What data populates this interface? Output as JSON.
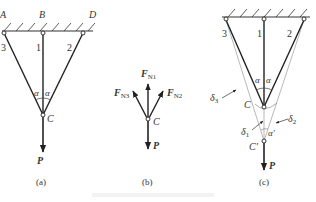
{
  "figure": {
    "panels": [
      {
        "id": "a",
        "caption": "(a)",
        "supports": [
          "A",
          "B",
          "D"
        ],
        "bars": [
          "1",
          "2",
          "3"
        ],
        "node": "C",
        "angle_label": "α",
        "load": "P"
      },
      {
        "id": "b",
        "caption": "(b)",
        "node": "C",
        "forces": {
          "n1": {
            "main": "F",
            "sub": "N1"
          },
          "n2": {
            "main": "F",
            "sub": "N2"
          },
          "n3": {
            "main": "F",
            "sub": "N3"
          },
          "p": "P"
        }
      },
      {
        "id": "c",
        "caption": "(c)",
        "bars": [
          "1",
          "2",
          "3"
        ],
        "node": "C",
        "node_displaced": "C′",
        "angle_label": "α",
        "angle_displaced": "α′",
        "deltas": {
          "d1": {
            "main": "δ",
            "sub": "1"
          },
          "d2": {
            "main": "δ",
            "sub": "2"
          },
          "d3": {
            "main": "δ",
            "sub": "3"
          }
        },
        "load": "P"
      }
    ]
  }
}
